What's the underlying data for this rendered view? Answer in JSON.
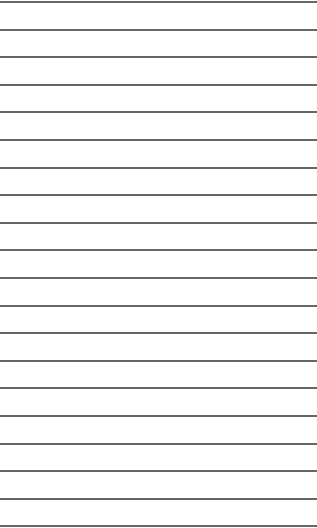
{
  "page": {
    "type": "lined-paper",
    "background": "#ffffff",
    "line_color": "#4a4a4a",
    "line_count": 20,
    "first_line_y": 1,
    "line_spacing": 27.6
  }
}
